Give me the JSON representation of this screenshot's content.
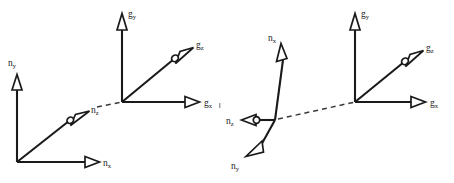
{
  "figure": {
    "background_color": "#ffffff",
    "line_color": "#1a1a1a",
    "width": 454,
    "height": 183,
    "panel_count": 2
  },
  "panels": [
    {
      "id": "left-panel",
      "name": "Left coordinate frame pair",
      "description": "n-frame at lower left joined by a dashed line to the g-frame at upper right",
      "frames": [
        {
          "id": "left-n-frame",
          "frame_label": "n",
          "origin": {
            "x": 17,
            "y": 162
          },
          "axes": [
            {
              "id": "left-n-x",
              "label_base": "n",
              "label_sub": "x",
              "label_text": "nx",
              "direction": "right",
              "arrowhead": "open-flat",
              "tip": {
                "x": 98,
                "y": 162
              },
              "label_pos": {
                "x": 103,
                "y": 166
              }
            },
            {
              "id": "left-n-y",
              "label_base": "n",
              "label_sub": "y",
              "label_text": "ny",
              "direction": "up",
              "arrowhead": "open-flat",
              "tip": {
                "x": 17,
                "y": 76
              },
              "label_pos": {
                "x": 11,
                "y": 66
              }
            },
            {
              "id": "left-n-z",
              "label_base": "n",
              "label_sub": "z",
              "label_text": "nz",
              "direction": "up-right-diagonal",
              "arrowhead": "open-flat-with-hub",
              "tip": {
                "x": 88,
                "y": 112
              },
              "label_pos": {
                "x": 91,
                "y": 111
              }
            }
          ]
        },
        {
          "id": "left-g-frame",
          "frame_label": "g",
          "origin": {
            "x": 122,
            "y": 102
          },
          "axes": [
            {
              "id": "left-g-x",
              "label_base": "g",
              "label_sub": "x",
              "label_text": "gx",
              "direction": "right",
              "arrowhead": "open-flat",
              "tip": {
                "x": 199,
                "y": 102
              },
              "label_pos": {
                "x": 204,
                "y": 106
              }
            },
            {
              "id": "left-g-y",
              "label_base": "g",
              "label_sub": "y",
              "label_text": "gy",
              "direction": "up",
              "arrowhead": "open-flat",
              "tip": {
                "x": 122,
                "y": 14
              },
              "label_pos": {
                "x": 127,
                "y": 14
              }
            },
            {
              "id": "left-g-z",
              "label_base": "g",
              "label_sub": "z",
              "label_text": "gz",
              "direction": "up-right-diagonal",
              "arrowhead": "open-flat-with-hub",
              "tip": {
                "x": 192,
                "y": 48
              },
              "label_pos": {
                "x": 195,
                "y": 47
              }
            }
          ]
        }
      ],
      "connector": {
        "id": "left-connector",
        "style": "dashed",
        "from": {
          "x": 97,
          "y": 107
        },
        "to": {
          "x": 122,
          "y": 102
        }
      }
    },
    {
      "id": "right-panel",
      "name": "Right coordinate frame pair",
      "description": "rotated n-frame at center joined by a dashed line to the g-frame at upper right",
      "frames": [
        {
          "id": "right-n-frame",
          "frame_label": "n",
          "origin": {
            "x": 275,
            "y": 120
          },
          "axes": [
            {
              "id": "right-n-x",
              "label_base": "n",
              "label_sub": "x",
              "label_text": "nx",
              "direction": "up-left",
              "arrowhead": "open-flat",
              "tip": {
                "x": 280,
                "y": 44
              },
              "label_pos": {
                "x": 271,
                "y": 40
              }
            },
            {
              "id": "right-n-y",
              "label_base": "n",
              "label_sub": "y",
              "label_text": "ny",
              "direction": "down-left",
              "arrowhead": "open-flat",
              "tip": {
                "x": 247,
                "y": 155
              },
              "label_pos": {
                "x": 233,
                "y": 166
              }
            },
            {
              "id": "right-n-z",
              "label_base": "n",
              "label_sub": "z",
              "label_text": "nz",
              "direction": "left",
              "arrowhead": "open-flat-with-hub",
              "tip": {
                "x": 248,
                "y": 120
              },
              "label_pos": {
                "x": 228,
                "y": 124
              }
            }
          ]
        },
        {
          "id": "right-g-frame",
          "frame_label": "g",
          "origin": {
            "x": 355,
            "y": 102
          },
          "axes": [
            {
              "id": "right-g-x",
              "label_base": "g",
              "label_sub": "x",
              "label_text": "gx",
              "direction": "right",
              "arrowhead": "open-flat",
              "tip": {
                "x": 425,
                "y": 102
              },
              "label_pos": {
                "x": 430,
                "y": 106
              }
            },
            {
              "id": "right-g-y",
              "label_base": "g",
              "label_sub": "y",
              "label_text": "gy",
              "direction": "up",
              "arrowhead": "open-flat",
              "tip": {
                "x": 355,
                "y": 14
              },
              "label_pos": {
                "x": 360,
                "y": 14
              }
            },
            {
              "id": "right-g-z",
              "label_base": "g",
              "label_sub": "z",
              "label_text": "gz",
              "direction": "up-right-diagonal",
              "arrowhead": "open-flat-with-hub",
              "tip": {
                "x": 422,
                "y": 51
              },
              "label_pos": {
                "x": 425,
                "y": 50
              }
            }
          ]
        }
      ],
      "connector": {
        "id": "right-connector",
        "style": "dashed",
        "from": {
          "x": 278,
          "y": 119
        },
        "to": {
          "x": 355,
          "y": 102
        }
      }
    }
  ]
}
